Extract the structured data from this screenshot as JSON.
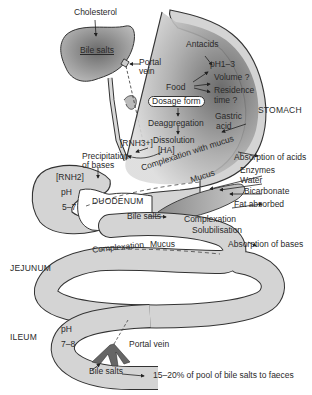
{
  "diagram": {
    "organs": {
      "liver": {
        "label": "Bile salts",
        "input": "Cholesterol"
      },
      "portal_vein_top": "Portal\nvein",
      "stomach": "STOMACH",
      "duodenum": "DUODENUM",
      "jejunum": "JEJUNUM",
      "ileum": "ILEUM"
    },
    "stomach_labels": {
      "antacids": "Antacids",
      "ph": "pH1–3",
      "food": "Food",
      "volume": "Volume ?",
      "residence_1": "Residence",
      "residence_2": "time ?",
      "dosage_form": "Dosage form",
      "deaggregation": "Deaggregation",
      "dissolution": "Dissolution",
      "gastric_1": "Gastric",
      "gastric_2": "acid",
      "rnh3": "[RNH3+]",
      "ha": "[HA]",
      "complexation_mucus": "Complexation with mucus",
      "mucus": "Mucus"
    },
    "duodenum_labels": {
      "precip_1": "Precipitation",
      "precip_2": "of bases",
      "rnh2": "[RNH2]",
      "ph_label": "pH",
      "ph_value": "5–7",
      "bile_salts": "Bile salts",
      "complexation": "Complexation",
      "solubilisation": "Solubilisation"
    },
    "right_labels": {
      "absorption_acids": "Absorption of acids",
      "enzymes": "Enzymes",
      "water": "Water",
      "bicarbonate": "Bicarbonate",
      "fat_absorbed": "Fat absorbed",
      "absorption_bases": "Absorption of bases"
    },
    "jejunum_labels": {
      "complexation": "Complexation",
      "mucus": "Mucus"
    },
    "ileum_labels": {
      "ph_label": "pH",
      "ph_value": "7–8",
      "portal_vein": "Portal vein",
      "bile_salts": "Bile salts",
      "faeces": "15–20% of pool of bile salts to faeces"
    },
    "colors": {
      "outline": "#333333",
      "tissue_fill": "#d4d4d4",
      "dark_fill": "#6e6e6e",
      "text": "#2a2a2a"
    }
  }
}
